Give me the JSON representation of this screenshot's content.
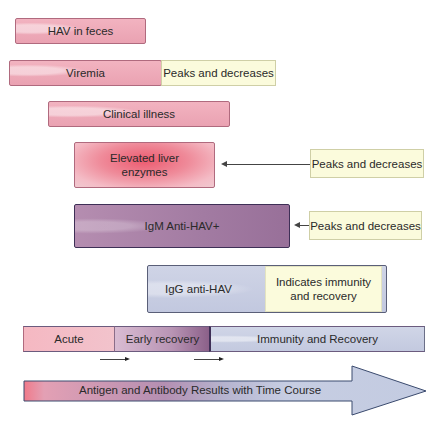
{
  "diagram": {
    "rows": [
      {
        "id": "hav-feces",
        "label": "HAV in feces"
      },
      {
        "id": "viremia",
        "label": "Viremia",
        "note": "Peaks and decreases"
      },
      {
        "id": "clinical-illness",
        "label": "Clinical illness"
      },
      {
        "id": "liver-enzymes",
        "label": "Elevated liver enzymes",
        "label_line1": "Elevated liver",
        "label_line2": "enzymes",
        "note": "Peaks and decreases"
      },
      {
        "id": "igm",
        "label": "IgM Anti-HAV+",
        "note": "Peaks and decreases"
      },
      {
        "id": "igg",
        "label": "IgG anti-HAV",
        "note": "Indicates immunity and recovery",
        "note_line1": "Indicates immunity",
        "note_line2": "and recovery"
      }
    ],
    "phases": [
      {
        "id": "acute",
        "label": "Acute"
      },
      {
        "id": "early-recovery",
        "label": "Early recovery"
      },
      {
        "id": "immunity-recovery",
        "label": "Immunity and Recovery"
      }
    ],
    "timeline": {
      "label": "Antigen and Antibody Results with Time Course"
    },
    "colors": {
      "antigen_pink": "#eea8b6",
      "liver_red": "#ec5a6f",
      "igm_purple": "#a27ba2",
      "igg_blue": "#c6cce2",
      "note_yellow": "#fbfbdc",
      "border_dark": "#3e2f56"
    }
  }
}
